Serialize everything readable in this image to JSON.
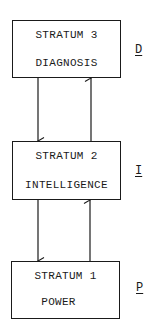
{
  "strata": [
    {
      "id": "stratum-3",
      "title": "STRATUM 3",
      "name": "DIAGNOSIS",
      "tag": "D"
    },
    {
      "id": "stratum-2",
      "title": "STRATUM 2",
      "name": "INTELLIGENCE",
      "tag": "I"
    },
    {
      "id": "stratum-1",
      "title": "STRATUM 1",
      "name": "POWER",
      "tag": "P"
    }
  ],
  "arrows": [
    {
      "from": "stratum-3",
      "to": "stratum-2",
      "direction": "down"
    },
    {
      "from": "stratum-2",
      "to": "stratum-3",
      "direction": "up"
    },
    {
      "from": "stratum-2",
      "to": "stratum-1",
      "direction": "down"
    },
    {
      "from": "stratum-1",
      "to": "stratum-2",
      "direction": "up"
    }
  ]
}
